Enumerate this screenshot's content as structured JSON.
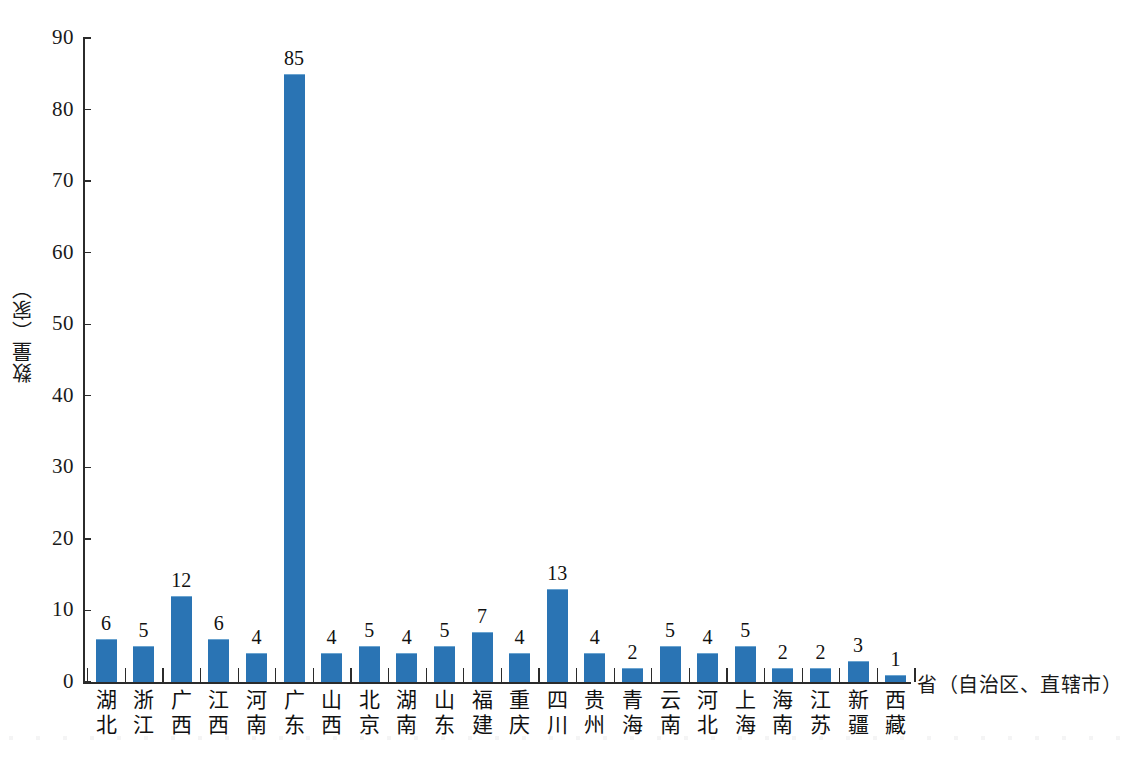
{
  "chart_data": {
    "type": "bar",
    "title": "",
    "xlabel": "省（自治区、直辖市）",
    "ylabel": "数量（家）",
    "categories": [
      "湖北",
      "浙江",
      "广西",
      "江西",
      "河南",
      "广东",
      "山西",
      "北京",
      "湖南",
      "山东",
      "福建",
      "重庆",
      "四川",
      "贵州",
      "青海",
      "云南",
      "河北",
      "上海",
      "海南",
      "江苏",
      "新疆",
      "西藏"
    ],
    "values": [
      6,
      5,
      12,
      6,
      4,
      85,
      4,
      5,
      4,
      5,
      7,
      4,
      13,
      4,
      2,
      5,
      4,
      5,
      2,
      2,
      3,
      1
    ],
    "ylim": [
      0,
      90
    ],
    "yticks": [
      0,
      10,
      20,
      30,
      40,
      50,
      60,
      70,
      80,
      90
    ],
    "ytick_labels": [
      "0",
      "10",
      "20",
      "30",
      "40",
      "50",
      "60",
      "70",
      "80",
      "90"
    ],
    "grid": false,
    "legend": null,
    "bar_color": "#2a74b4",
    "axis_color": "#2b2b2b",
    "background": "#ffffff",
    "data_labels": [
      "6",
      "5",
      "12",
      "6",
      "4",
      "85",
      "4",
      "5",
      "4",
      "5",
      "7",
      "4",
      "13",
      "4",
      "2",
      "5",
      "4",
      "5",
      "2",
      "2",
      "3",
      "1"
    ]
  }
}
